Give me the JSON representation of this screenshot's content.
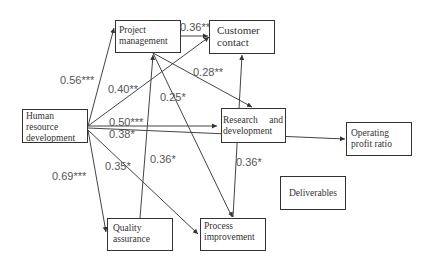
{
  "nodes": {
    "hrd": "Human resource development",
    "pm": "Project management",
    "cc": "Customer contact",
    "rd": "Research and development",
    "opr": "Operating profit ratio",
    "del": "Deliverables",
    "qa": "Quality assurance",
    "pi": "Process improvement"
  },
  "node_lines": {
    "hrd": [
      "Human",
      "resource",
      "development"
    ],
    "pm": [
      "Project",
      "management"
    ],
    "cc": [
      "Customer",
      "contact"
    ],
    "rd": [
      "Research  and",
      "development"
    ],
    "opr": [
      "Operating",
      "profit ratio"
    ],
    "del": [
      "Deliverables"
    ],
    "qa": [
      "Quality",
      "assurance"
    ],
    "pi": [
      "Process",
      "improvement"
    ]
  },
  "edges": [
    {
      "from": "Human resource development",
      "to": "Project management",
      "label": "0.56***"
    },
    {
      "from": "Human resource development",
      "to": "Customer contact",
      "label": "0.40**"
    },
    {
      "from": "Human resource development",
      "to": "Research and development",
      "label": "0.50***"
    },
    {
      "from": "Human resource development",
      "to": "Operating profit ratio",
      "label": "0.38*"
    },
    {
      "from": "Human resource development",
      "to": "Quality assurance",
      "label": "0.69***"
    },
    {
      "from": "Human resource development",
      "to": "Process improvement",
      "label": "0.35*"
    },
    {
      "from": "Project management",
      "to": "Customer contact",
      "label": "0.36**"
    },
    {
      "from": "Project management",
      "to": "Research and development",
      "label": "0.28**"
    },
    {
      "from": "Project management",
      "to": "Process improvement",
      "label": "0.25*"
    },
    {
      "from": "Quality assurance",
      "to": "Project management",
      "label": "0.36*"
    },
    {
      "from": "Process improvement",
      "to": "Customer contact",
      "label": "0.36*"
    }
  ],
  "labels": {
    "e_hrd_pm": "0.56***",
    "e_hrd_cc": "0.40**",
    "e_hrd_rd": "0.50***",
    "e_hrd_opr": "0.38*",
    "e_hrd_qa": "0.69***",
    "e_hrd_pi": "0.35*",
    "e_pm_cc": "0.36**",
    "e_pm_rd": "0.28**",
    "e_pm_pi": "0.25*",
    "e_qa_pm": "0.36*",
    "e_pi_cc": "0.36*"
  }
}
